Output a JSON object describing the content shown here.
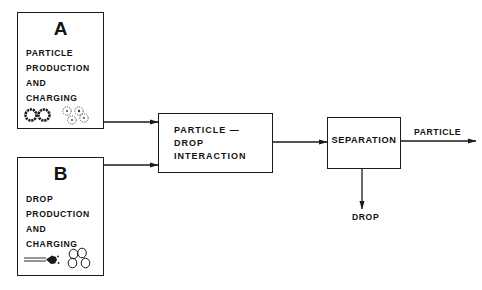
{
  "diagram": {
    "type": "process-flow",
    "blocks": {
      "a": {
        "letter": "A",
        "lines": [
          "PARTICLE",
          "PRODUCTION",
          "AND",
          "CHARGING"
        ],
        "icons": [
          "solid-particles-icon",
          "charged-particles-icon"
        ]
      },
      "b": {
        "letter": "B",
        "lines": [
          "DROP",
          "PRODUCTION",
          "AND",
          "CHARGING"
        ],
        "icons": [
          "spray-nozzle-icon",
          "drops-icon"
        ]
      },
      "interaction": {
        "lines": [
          "PARTICLE —",
          "DROP",
          "INTERACTION"
        ]
      },
      "separation": {
        "label": "SEPARATION"
      }
    },
    "outputs": {
      "particle": "PARTICLE",
      "drop": "DROP"
    },
    "edges": [
      {
        "from": "A",
        "to": "PARTICLE — DROP INTERACTION"
      },
      {
        "from": "B",
        "to": "PARTICLE — DROP INTERACTION"
      },
      {
        "from": "PARTICLE — DROP INTERACTION",
        "to": "SEPARATION"
      },
      {
        "from": "SEPARATION",
        "to": "PARTICLE"
      },
      {
        "from": "SEPARATION",
        "to": "DROP"
      }
    ],
    "colors": {
      "ink": "#1a1a1a",
      "background": "#ffffff"
    }
  }
}
